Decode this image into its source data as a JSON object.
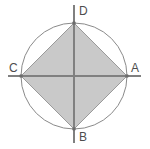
{
  "figure": {
    "background_color": "#ffffff",
    "canvas": {
      "width": 150,
      "height": 149
    },
    "colors": {
      "square_fill": "#c9c9c9",
      "square_stroke": "#9a9a9a",
      "circle_stroke": "#8a8a8a",
      "axis_stroke": "#808080",
      "label_color": "#4d4d4d"
    },
    "circle": {
      "center_x": 74,
      "center_y": 76,
      "radius": 53,
      "stroke_width": 1
    },
    "square": {
      "orientation": "diamond",
      "stroke_width": 1,
      "vertices": [
        {
          "label": "D",
          "x": 74,
          "y": 23
        },
        {
          "label": "A",
          "x": 127,
          "y": 76
        },
        {
          "label": "B",
          "x": 74,
          "y": 129
        },
        {
          "label": "C",
          "x": 21,
          "y": 76
        }
      ],
      "points_attr": "74,23 127,76 74,129 21,76"
    },
    "axes": {
      "stroke_width": 2,
      "horizontal": {
        "x1": 8,
        "y1": 76,
        "x2": 141,
        "y2": 76
      },
      "vertical": {
        "x1": 74,
        "y1": 5,
        "x2": 74,
        "y2": 143
      }
    },
    "labels": {
      "top": "D",
      "right": "A",
      "bottom": "B",
      "left": "C"
    }
  }
}
